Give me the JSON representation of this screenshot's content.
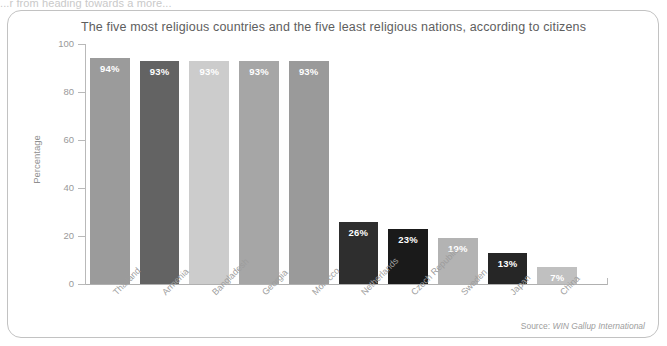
{
  "cut_headline": "...r from heading towards a more...",
  "card": {
    "source_prefix": "Source: ",
    "source_name": "WIN Gallup International"
  },
  "chart_data": {
    "type": "bar",
    "title": "The five most religious countries and the five least religious nations, according to citizens",
    "xlabel": "",
    "ylabel": "Percentage",
    "ylim": [
      0,
      100
    ],
    "yticks": [
      0,
      20,
      40,
      60,
      80,
      100
    ],
    "ytick_labels": [
      "0",
      "20",
      "40",
      "60",
      "80",
      "100"
    ],
    "grid": false,
    "legend": null,
    "categories": [
      "Thailand",
      "Armenia",
      "Bangladesh",
      "Georgia",
      "Morocco",
      "Netherlands",
      "Czech Republic",
      "Sweden",
      "Japan",
      "China"
    ],
    "values": [
      94,
      93,
      93,
      93,
      93,
      26,
      23,
      19,
      13,
      7
    ],
    "data_labels": [
      "94%",
      "93%",
      "93%",
      "93%",
      "93%",
      "26%",
      "23%",
      "19%",
      "13%",
      "7%"
    ],
    "bar_colors": [
      "#9b9b9b",
      "#636363",
      "#cccccc",
      "#a6a6a6",
      "#9a9a9a",
      "#2e2e2e",
      "#1a1a1a",
      "#b3b3b3",
      "#262626",
      "#c0c0c0"
    ]
  }
}
